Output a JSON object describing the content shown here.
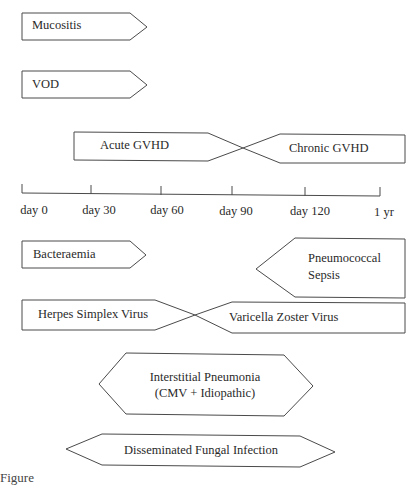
{
  "diagram": {
    "title_hint": "Timeline of complications after transplant",
    "axis": {
      "ticks": [
        "day 0",
        "day 30",
        "day 60",
        "day 90",
        "day 120",
        "1 yr"
      ]
    },
    "events": {
      "mucositis": "Mucositis",
      "vod": "VOD",
      "acute_gvhd": "Acute GVHD",
      "chronic_gvhd": "Chronic GVHD",
      "bacteraemia": "Bacteraemia",
      "pneumococcal_line1": "Pneumococcal",
      "pneumococcal_line2": "Sepsis",
      "herpes": "Herpes Simplex Virus",
      "varicella": "Varicella Zoster Virus",
      "interstitial_line1": "Interstitial Pneumonia",
      "interstitial_line2": "(CMV + Idiopathic)",
      "fungal": "Disseminated Fungal Infection"
    },
    "caption_fragment": "Figure"
  }
}
